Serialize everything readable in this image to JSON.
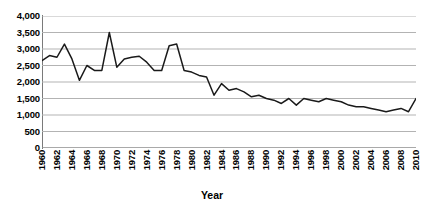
{
  "chart_data": {
    "type": "line",
    "title": "",
    "xlabel": "Year",
    "ylabel": "",
    "xlim": [
      1960,
      2010
    ],
    "ylim": [
      0,
      4000
    ],
    "ytick_step": 500,
    "xtick_step": 2,
    "grid": true,
    "grid_color": "#b3b3b3",
    "line_color": "#1a1a1a",
    "legend": "none",
    "y_ticks": [
      "0",
      "500",
      "1,000",
      "1,500",
      "2,000",
      "2,500",
      "3,000",
      "3,500",
      "4,000"
    ],
    "x_ticks": [
      "1960",
      "1962",
      "1964",
      "1966",
      "1968",
      "1970",
      "1972",
      "1974",
      "1976",
      "1978",
      "1980",
      "1982",
      "1984",
      "1986",
      "1988",
      "1990",
      "1992",
      "1994",
      "1996",
      "1998",
      "2000",
      "2002",
      "2004",
      "2006",
      "2008",
      "2010"
    ],
    "x": [
      1960,
      1961,
      1962,
      1963,
      1964,
      1965,
      1966,
      1967,
      1968,
      1969,
      1970,
      1971,
      1972,
      1973,
      1974,
      1975,
      1976,
      1977,
      1978,
      1979,
      1980,
      1981,
      1982,
      1983,
      1984,
      1985,
      1986,
      1987,
      1988,
      1989,
      1990,
      1991,
      1992,
      1993,
      1994,
      1995,
      1996,
      1997,
      1998,
      1999,
      2000,
      2001,
      2002,
      2003,
      2004,
      2005,
      2006,
      2007,
      2008,
      2009,
      2010
    ],
    "values": [
      2650,
      2800,
      2750,
      3150,
      2700,
      2050,
      2500,
      2350,
      2350,
      3500,
      2450,
      2700,
      2750,
      2780,
      2600,
      2350,
      2350,
      3100,
      3150,
      2350,
      2300,
      2200,
      2150,
      1600,
      1950,
      1750,
      1800,
      1700,
      1550,
      1600,
      1500,
      1450,
      1350,
      1500,
      1300,
      1500,
      1450,
      1400,
      1500,
      1450,
      1400,
      1300,
      1250,
      1250,
      1200,
      1150,
      1100,
      1150,
      1200,
      1100,
      1500
    ],
    "annotations": []
  },
  "axis": {
    "x_title": "Year"
  }
}
